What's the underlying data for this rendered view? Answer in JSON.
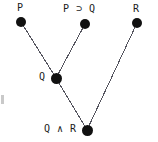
{
  "diagram": {
    "type": "proof-tree",
    "background_color": "#ffffff",
    "node_color": "#111111",
    "edge_color": "#55555f",
    "label_color": "#1a1a1a",
    "nodes": [
      {
        "id": "p",
        "label": "P",
        "x": 21,
        "y": 22,
        "r": 5.0,
        "label_x": 17,
        "label_y": 2,
        "label_align": "left"
      },
      {
        "id": "pimpq",
        "label": "P ⊃ Q",
        "x": 85,
        "y": 24,
        "r": 5.0,
        "label_x": 63,
        "label_y": 3,
        "label_align": "left"
      },
      {
        "id": "r",
        "label": "R",
        "x": 137,
        "y": 23,
        "r": 5.0,
        "label_x": 133,
        "label_y": 3,
        "label_align": "left"
      },
      {
        "id": "q",
        "label": "Q",
        "x": 56,
        "y": 78,
        "r": 5.5,
        "label_x": 39,
        "label_y": 71,
        "label_align": "left"
      },
      {
        "id": "qandr",
        "label": "Q ∧ R",
        "x": 87,
        "y": 130,
        "r": 5.5,
        "label_x": 44,
        "label_y": 123,
        "label_align": "left"
      }
    ],
    "edges": [
      {
        "id": "edge-p-q",
        "from": "p",
        "to": "q"
      },
      {
        "id": "edge-pimpq-q",
        "from": "pimpq",
        "to": "q"
      },
      {
        "id": "edge-q-qandr",
        "from": "q",
        "to": "qandr"
      },
      {
        "id": "edge-r-qandr",
        "from": "r",
        "to": "qandr"
      }
    ],
    "margin_mark": {
      "x": 1,
      "y": 95,
      "width": 3,
      "height": 9,
      "color": "#c9c9c9"
    }
  }
}
